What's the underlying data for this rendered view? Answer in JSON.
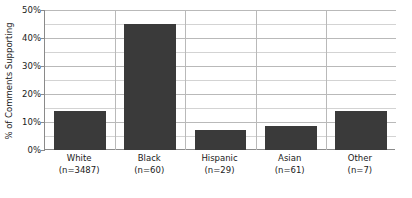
{
  "chart_data": {
    "type": "bar",
    "title": "",
    "subtitle": "",
    "xlabel": "",
    "ylabel": "% of Comments Supporting",
    "categories": [
      "White",
      "Black",
      "Hispanic",
      "Asian",
      "Other"
    ],
    "category_sublabels": [
      "(n=3487)",
      "(n=60)",
      "(n=29)",
      "(n=61)",
      "(n=7)"
    ],
    "sample_sizes": [
      3487,
      60,
      29,
      61,
      7
    ],
    "values": [
      14,
      45,
      7,
      8.5,
      14
    ],
    "ylim": [
      0,
      50
    ],
    "ytick_labels": [
      "0%",
      "10%",
      "20%",
      "30%",
      "40%",
      "50%"
    ],
    "ytick_values": [
      0,
      10,
      20,
      30,
      40,
      50
    ],
    "minor_gridline_values": [
      5,
      15,
      25,
      35,
      45
    ],
    "grid": true,
    "legend": "none",
    "bar_color": "#3a3a3a",
    "grid_color": "#d3d3d3",
    "major_grid_color": "#b9b9b9",
    "axis_color": "#8a8a8a",
    "background_color": "#ffffff",
    "text_color": "#1a1a1a"
  }
}
